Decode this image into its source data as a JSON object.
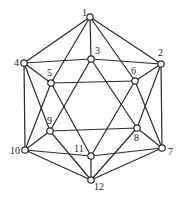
{
  "diagram": {
    "type": "graph",
    "colors": {
      "edge": "#2a2a2a",
      "node_fill": "#ffffff",
      "label": "#222222"
    },
    "node_radius": 3.2,
    "nodes": [
      {
        "id": "1",
        "x": 90,
        "y": 17,
        "lx": 82,
        "ly": 16
      },
      {
        "id": "2",
        "x": 161,
        "y": 64,
        "lx": 158,
        "ly": 56
      },
      {
        "id": "3",
        "x": 91,
        "y": 59,
        "lx": 95,
        "ly": 54
      },
      {
        "id": "4",
        "x": 24,
        "y": 63,
        "lx": 14,
        "ly": 66
      },
      {
        "id": "5",
        "x": 51,
        "y": 83,
        "lx": 47,
        "ly": 76
      },
      {
        "id": "6",
        "x": 135,
        "y": 81,
        "lx": 131,
        "ly": 74
      },
      {
        "id": "7",
        "x": 162,
        "y": 148,
        "lx": 168,
        "ly": 155
      },
      {
        "id": "8",
        "x": 137,
        "y": 128,
        "lx": 134,
        "ly": 141
      },
      {
        "id": "9",
        "x": 50,
        "y": 131,
        "lx": 47,
        "ly": 124
      },
      {
        "id": "10",
        "x": 25,
        "y": 150,
        "lx": 10,
        "ly": 154
      },
      {
        "id": "11",
        "x": 91,
        "y": 156,
        "lx": 74,
        "ly": 152
      },
      {
        "id": "12",
        "x": 91,
        "y": 180,
        "lx": 94,
        "ly": 190
      }
    ],
    "edges": [
      [
        "1",
        "2"
      ],
      [
        "1",
        "3"
      ],
      [
        "1",
        "4"
      ],
      [
        "1",
        "5"
      ],
      [
        "1",
        "6"
      ],
      [
        "2",
        "3"
      ],
      [
        "2",
        "6"
      ],
      [
        "2",
        "7"
      ],
      [
        "2",
        "8"
      ],
      [
        "3",
        "4"
      ],
      [
        "3",
        "8"
      ],
      [
        "3",
        "9"
      ],
      [
        "4",
        "5"
      ],
      [
        "4",
        "9"
      ],
      [
        "4",
        "10"
      ],
      [
        "5",
        "6"
      ],
      [
        "5",
        "10"
      ],
      [
        "5",
        "11"
      ],
      [
        "6",
        "7"
      ],
      [
        "6",
        "11"
      ],
      [
        "7",
        "8"
      ],
      [
        "7",
        "11"
      ],
      [
        "7",
        "12"
      ],
      [
        "8",
        "9"
      ],
      [
        "8",
        "12"
      ],
      [
        "9",
        "10"
      ],
      [
        "9",
        "12"
      ],
      [
        "10",
        "11"
      ],
      [
        "10",
        "12"
      ],
      [
        "11",
        "12"
      ]
    ]
  }
}
